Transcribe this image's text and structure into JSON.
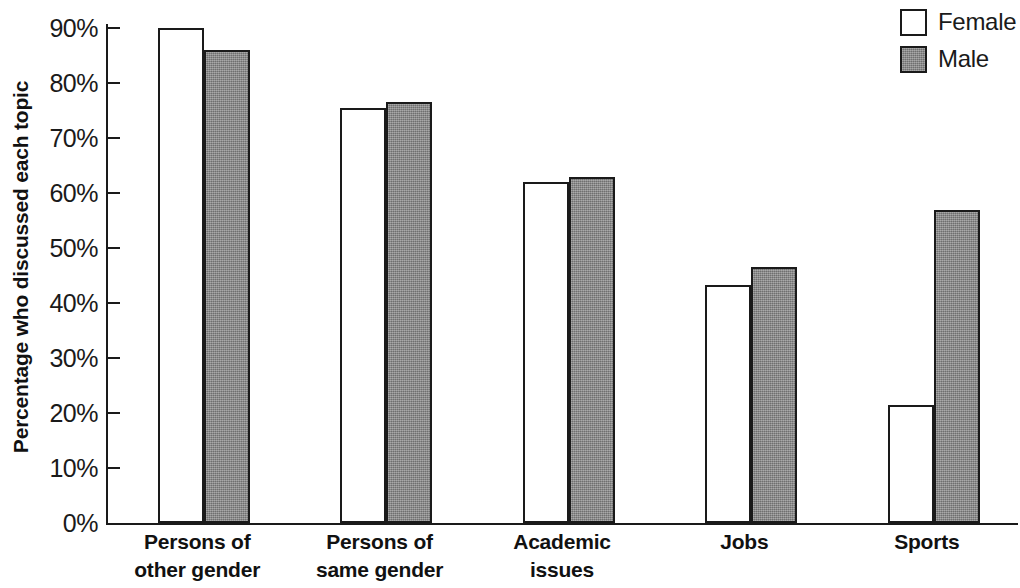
{
  "chart_data": {
    "type": "bar",
    "title": "",
    "xlabel": "",
    "ylabel": "Percentage who discussed each topic",
    "ylim": [
      0,
      90
    ],
    "ytick_labels": [
      "90%",
      "80%",
      "70%",
      "60%",
      "50%",
      "40%",
      "30%",
      "20%",
      "10%",
      "0%"
    ],
    "ytick_values": [
      90,
      80,
      70,
      60,
      50,
      40,
      30,
      20,
      10,
      0
    ],
    "grid": false,
    "legend_position": "top-right",
    "categories": [
      "Persons of other gender",
      "Persons of same gender",
      "Academic issues",
      "Jobs",
      "Sports"
    ],
    "category_lines": [
      [
        "Persons of",
        "other gender"
      ],
      [
        "Persons of",
        "same gender"
      ],
      [
        "Academic",
        "issues"
      ],
      [
        "Jobs",
        ""
      ],
      [
        "Sports",
        ""
      ]
    ],
    "series": [
      {
        "name": "Female",
        "color": "#ffffff",
        "values": [
          90.0,
          75.5,
          62.0,
          43.3,
          21.5
        ]
      },
      {
        "name": "Male",
        "color": "#878787",
        "values": [
          86.0,
          76.5,
          63.0,
          46.5,
          57.0
        ]
      }
    ]
  },
  "legend": {
    "items": [
      {
        "label": "Female",
        "swatch": "female"
      },
      {
        "label": "Male",
        "swatch": "male"
      }
    ]
  },
  "axis": {
    "title_y": "Percentage who discussed each topic"
  }
}
